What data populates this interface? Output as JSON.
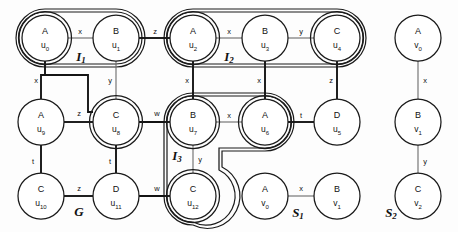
{
  "figure": {
    "width": 458,
    "height": 232,
    "background": "#fdfdfd",
    "stroke_color": "#1a1a1a",
    "thin_edge_color": "#6b6b6b",
    "thick_edge_color": "#141414"
  },
  "graphs": [
    {
      "name": "G",
      "label_main": "G",
      "label_sub": "",
      "x": 79,
      "y": 213
    },
    {
      "name": "S1",
      "label_main": "S",
      "label_sub": "1",
      "x": 298,
      "y": 214
    },
    {
      "name": "S2",
      "label_main": "S",
      "label_sub": "2",
      "x": 391,
      "y": 214
    }
  ],
  "regions": [
    {
      "name": "I1",
      "label_main": "I",
      "label_sub": "1",
      "label_x": 81,
      "label_y": 58
    },
    {
      "name": "I2",
      "label_main": "I",
      "label_sub": "2",
      "label_x": 229,
      "label_y": 58
    },
    {
      "name": "I3",
      "label_main": "I",
      "label_sub": "3",
      "label_x": 177,
      "label_y": 157
    }
  ],
  "nodes": [
    {
      "id": "u0",
      "type": "A",
      "name_main": "u",
      "name_sub": "0",
      "cx": 45,
      "cy": 38,
      "r": 23,
      "double": true,
      "graph": "G"
    },
    {
      "id": "u1",
      "type": "B",
      "name_main": "u",
      "name_sub": "1",
      "cx": 116,
      "cy": 38,
      "r": 23,
      "double": false,
      "graph": "G"
    },
    {
      "id": "u2",
      "type": "A",
      "name_main": "u",
      "name_sub": "2",
      "cx": 193,
      "cy": 38,
      "r": 23,
      "double": true,
      "graph": "G"
    },
    {
      "id": "u3",
      "type": "B",
      "name_main": "u",
      "name_sub": "3",
      "cx": 265,
      "cy": 38,
      "r": 23,
      "double": false,
      "graph": "G"
    },
    {
      "id": "u4",
      "type": "C",
      "name_main": "u",
      "name_sub": "4",
      "cx": 337,
      "cy": 38,
      "r": 23,
      "double": true,
      "graph": "G"
    },
    {
      "id": "u9",
      "type": "A",
      "name_main": "u",
      "name_sub": "9",
      "cx": 41,
      "cy": 122,
      "r": 23,
      "double": false,
      "graph": "G"
    },
    {
      "id": "u8",
      "type": "C",
      "name_main": "u",
      "name_sub": "8",
      "cx": 116,
      "cy": 122,
      "r": 23,
      "double": true,
      "graph": "G"
    },
    {
      "id": "u7",
      "type": "B",
      "name_main": "u",
      "name_sub": "7",
      "cx": 193,
      "cy": 122,
      "r": 23,
      "double": true,
      "graph": "G"
    },
    {
      "id": "u6",
      "type": "A",
      "name_main": "u",
      "name_sub": "6",
      "cx": 265,
      "cy": 122,
      "r": 23,
      "double": true,
      "graph": "G"
    },
    {
      "id": "u5",
      "type": "D",
      "name_main": "u",
      "name_sub": "5",
      "cx": 337,
      "cy": 122,
      "r": 23,
      "double": false,
      "graph": "G"
    },
    {
      "id": "u10",
      "type": "C",
      "name_main": "u",
      "name_sub": "10",
      "cx": 41,
      "cy": 196,
      "r": 23,
      "double": false,
      "graph": "G"
    },
    {
      "id": "u11",
      "type": "D",
      "name_main": "u",
      "name_sub": "11",
      "cx": 116,
      "cy": 196,
      "r": 23,
      "double": false,
      "graph": "G"
    },
    {
      "id": "u12",
      "type": "C",
      "name_main": "u",
      "name_sub": "12",
      "cx": 193,
      "cy": 196,
      "r": 23,
      "double": true,
      "graph": "G"
    },
    {
      "id": "s1v0",
      "type": "A",
      "name_main": "v",
      "name_sub": "0",
      "cx": 265,
      "cy": 196,
      "r": 23,
      "double": false,
      "graph": "S1"
    },
    {
      "id": "s1v1",
      "type": "B",
      "name_main": "v",
      "name_sub": "1",
      "cx": 337,
      "cy": 196,
      "r": 23,
      "double": false,
      "graph": "S1"
    },
    {
      "id": "s2v0",
      "type": "A",
      "name_main": "v",
      "name_sub": "0",
      "cx": 418,
      "cy": 38,
      "r": 23,
      "double": false,
      "graph": "S2"
    },
    {
      "id": "s2v1",
      "type": "B",
      "name_main": "v",
      "name_sub": "1",
      "cx": 418,
      "cy": 122,
      "r": 23,
      "double": false,
      "graph": "S2"
    },
    {
      "id": "s2v2",
      "type": "C",
      "name_main": "v",
      "name_sub": "2",
      "cx": 418,
      "cy": 196,
      "r": 23,
      "double": false,
      "graph": "S2"
    }
  ],
  "edges": [
    {
      "from": "u0",
      "to": "u1",
      "label": "x",
      "weight": "thin",
      "label_x": 80,
      "label_y": 32
    },
    {
      "from": "u1",
      "to": "u2",
      "label": "z",
      "weight": "thick",
      "label_x": 155,
      "label_y": 32
    },
    {
      "from": "u2",
      "to": "u3",
      "label": "x",
      "weight": "thin",
      "label_x": 229,
      "label_y": 32
    },
    {
      "from": "u3",
      "to": "u4",
      "label": "y",
      "weight": "thin",
      "label_x": 301,
      "label_y": 32
    },
    {
      "from": "u0",
      "to": "u9",
      "label": "x",
      "weight": "thick",
      "label_x": 36,
      "label_y": 81
    },
    {
      "from": "u1",
      "to": "u8",
      "label": "y",
      "weight": "thin",
      "label_x": 110,
      "label_y": 81
    },
    {
      "from": "u2",
      "to": "u7",
      "label": "x",
      "weight": "thick",
      "label_x": 187,
      "label_y": 81
    },
    {
      "from": "u3",
      "to": "u6",
      "label": "x",
      "weight": "thick",
      "label_x": 259,
      "label_y": 81
    },
    {
      "from": "u4",
      "to": "u5",
      "label": "z",
      "weight": "thick",
      "label_x": 331,
      "label_y": 81
    },
    {
      "from": "u9",
      "to": "u8",
      "label": "z",
      "weight": "thick",
      "label_x": 79,
      "label_y": 114
    },
    {
      "from": "u8",
      "to": "u7",
      "label": "w",
      "weight": "thick",
      "label_x": 157,
      "label_y": 114
    },
    {
      "from": "u7",
      "to": "u6",
      "label": "x",
      "weight": "thin",
      "label_x": 229,
      "label_y": 116
    },
    {
      "from": "u6",
      "to": "u5",
      "label": "t",
      "weight": "thick",
      "label_x": 301,
      "label_y": 116
    },
    {
      "from": "u9",
      "to": "u10",
      "label": "t",
      "weight": "thick",
      "label_x": 33,
      "label_y": 162
    },
    {
      "from": "u8",
      "to": "u11",
      "label": "t",
      "weight": "thick",
      "label_x": 110,
      "label_y": 162
    },
    {
      "from": "u7",
      "to": "u12",
      "label": "y",
      "weight": "thin",
      "label_x": 200,
      "label_y": 160
    },
    {
      "from": "u10",
      "to": "u11",
      "label": "z",
      "weight": "thick",
      "label_x": 79,
      "label_y": 189
    },
    {
      "from": "u11",
      "to": "u12",
      "label": "w",
      "weight": "thick",
      "label_x": 157,
      "label_y": 189
    },
    {
      "from": "s1v0",
      "to": "s1v1",
      "label": "x",
      "weight": "thin",
      "label_x": 301,
      "label_y": 189
    },
    {
      "from": "s2v0",
      "to": "s2v1",
      "label": "x",
      "weight": "thin",
      "label_x": 425,
      "label_y": 81
    },
    {
      "from": "s2v1",
      "to": "s2v2",
      "label": "y",
      "weight": "thin",
      "label_x": 425,
      "label_y": 162
    }
  ],
  "node_types": [
    "A",
    "B",
    "C",
    "D"
  ],
  "edge_labels": [
    "x",
    "y",
    "z",
    "t",
    "w"
  ]
}
